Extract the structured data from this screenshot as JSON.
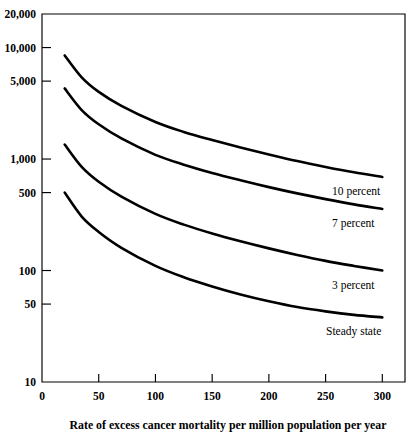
{
  "chart_data": {
    "type": "line",
    "title": "",
    "subtitle": "",
    "xlabel": "Rate of excess cancer mortality per million population per year",
    "ylabel": "",
    "xlim": [
      0,
      320
    ],
    "ylim": [
      10,
      20000
    ],
    "yscale": "log",
    "xscale": "linear",
    "grid": false,
    "legend_position": "inline-right-of-curve",
    "xticks": [
      0,
      50,
      100,
      150,
      200,
      250,
      300
    ],
    "xtick_labels": [
      "0",
      "50",
      "100",
      "150",
      "200",
      "250",
      "300"
    ],
    "yticks": [
      10,
      50,
      100,
      500,
      1000,
      5000,
      10000,
      20000
    ],
    "ytick_labels": [
      "10",
      "50",
      "100",
      "500",
      "1,000",
      "5,000",
      "10,000",
      "20,000"
    ],
    "x": [
      20,
      35,
      50,
      70,
      100,
      125,
      150,
      175,
      200,
      225,
      250,
      275,
      300
    ],
    "series": [
      {
        "name": "10 percent",
        "label": "10 percent",
        "color": "#000000",
        "values": [
          8500,
          5400,
          4000,
          3000,
          2150,
          1750,
          1480,
          1270,
          1100,
          960,
          850,
          760,
          690
        ]
      },
      {
        "name": "7 percent",
        "label": "7 percent",
        "color": "#000000",
        "values": [
          4300,
          2750,
          2050,
          1530,
          1090,
          890,
          750,
          645,
          560,
          492,
          437,
          392,
          357
        ]
      },
      {
        "name": "3 percent",
        "label": "3 percent",
        "color": "#000000",
        "values": [
          1350,
          850,
          625,
          460,
          322,
          258,
          215,
          183,
          158,
          138,
          122,
          110,
          100
        ]
      },
      {
        "name": "Steady state",
        "label": "Steady state",
        "color": "#000000",
        "values": [
          500,
          305,
          222,
          160,
          110,
          87,
          72,
          61,
          53,
          47,
          43,
          40,
          38
        ]
      }
    ]
  },
  "figure": {
    "background_color": "#ffffff",
    "axis_color": "#000000",
    "curve_color": "#000000"
  }
}
